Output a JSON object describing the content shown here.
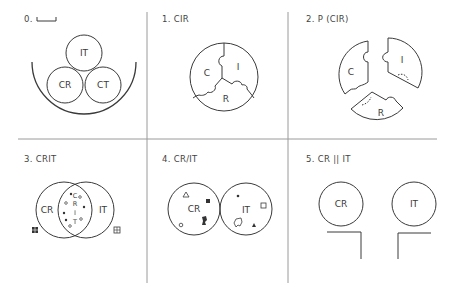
{
  "panels": [
    {
      "id": "0",
      "title": "0.",
      "labels": [
        "IT",
        "CR",
        "CT"
      ]
    },
    {
      "id": "1",
      "title": "1. CIR",
      "labels": [
        "C",
        "I",
        "R"
      ]
    },
    {
      "id": "2",
      "title": "2. P (CIR)",
      "labels": [
        "C",
        "I",
        "R"
      ]
    },
    {
      "id": "3",
      "title": "3. CRIT",
      "labels": [
        "CR",
        "IT",
        "C",
        "R",
        "I",
        "T"
      ]
    },
    {
      "id": "4",
      "title": "4. CR/IT",
      "labels": [
        "CR",
        "IT"
      ]
    },
    {
      "id": "5",
      "title": "5. CR || IT",
      "labels": [
        "CR",
        "IT"
      ]
    }
  ],
  "colors": {
    "line": "#3a3a3a",
    "grid": "#9a9a9a",
    "background": "#ffffff"
  }
}
